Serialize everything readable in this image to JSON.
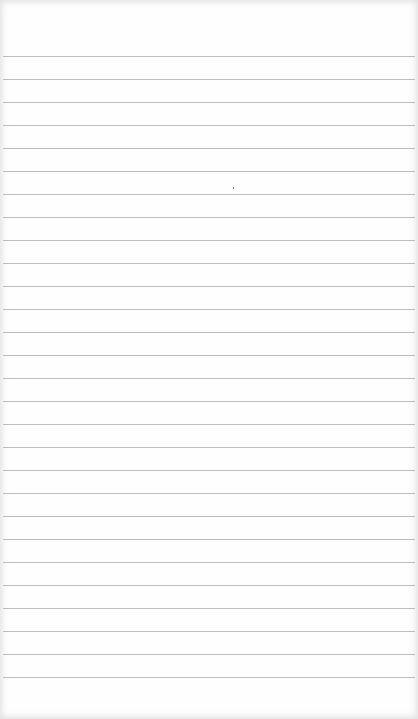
{
  "page": {
    "type": "lined-notepad",
    "background_color": "#fefefe",
    "line_color": "#bdbdbd",
    "first_line_y": 56,
    "line_spacing": 23,
    "line_count": 28
  },
  "marks": [
    {
      "x": 233,
      "y": 187
    }
  ]
}
